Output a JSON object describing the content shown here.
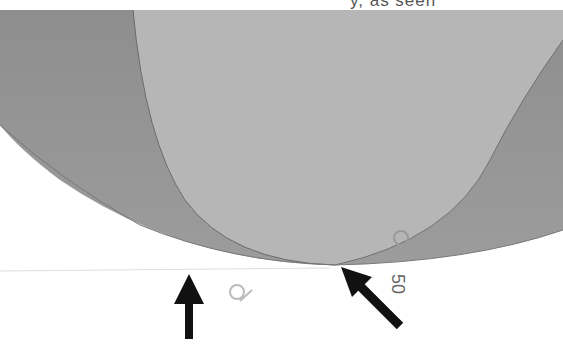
{
  "document": {
    "clipped_header_text": "y, as seen",
    "figure": {
      "description": "Scanned figure of a curved lens-like surface with two arrows pointing at its lower edge",
      "label_number": "50",
      "colors": {
        "outer_dark": "#8f8f8f",
        "inner_light": "#b4b4b4",
        "edge": "#6a6a6a",
        "arrow": "#111111"
      }
    }
  }
}
